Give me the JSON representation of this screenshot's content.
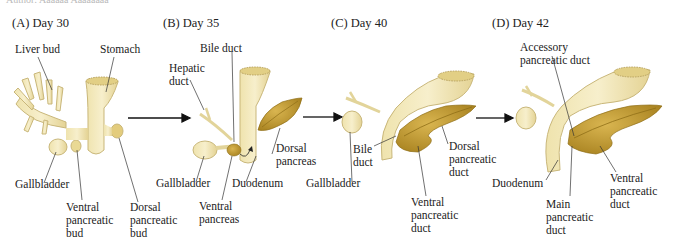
{
  "caption_fragment": "Author: Aaaaaa Aaaaaaaa",
  "panels": [
    {
      "id": "A",
      "title": "(A)  Day 30",
      "labels": {
        "liver_bud": "Liver bud",
        "stomach": "Stomach",
        "gallbladder": "Gallbladder",
        "ventral_bud": "Ventral\npancreatic\nbud",
        "dorsal_bud": "Dorsal\npancreatic\nbud"
      }
    },
    {
      "id": "B",
      "title": "(B)  Day 35",
      "labels": {
        "bile_duct": "Bile duct",
        "hepatic_duct": "Hepatic\nduct",
        "dorsal_pancreas": "Dorsal\npancreas",
        "gallbladder": "Gallbladder",
        "duodenum": "Duodenum",
        "ventral_pancreas": "Ventral\npancreas"
      }
    },
    {
      "id": "C",
      "title": "(C)  Day 40",
      "labels": {
        "bile_duct": "Bile\nduct",
        "gallbladder": "Gallbladder",
        "dorsal_duct": "Dorsal\npancreatic\nduct",
        "ventral_duct": "Ventral\npancreatic\nduct"
      }
    },
    {
      "id": "D",
      "title": "(D)  Day 42",
      "labels": {
        "accessory_duct": "Accessory\npancreatic duct",
        "duodenum": "Duodenum",
        "main_duct": "Main\npancreatic\nduct",
        "ventral_duct": "Ventral\npancreatic\nduct"
      }
    }
  ],
  "colors": {
    "gut": "#f1e6b6",
    "gut_edge": "#c9b77a",
    "pancreas": "#c9a23a",
    "pancreas_dark": "#8f6e17",
    "leader": "#333333",
    "arrow": "#111111"
  }
}
